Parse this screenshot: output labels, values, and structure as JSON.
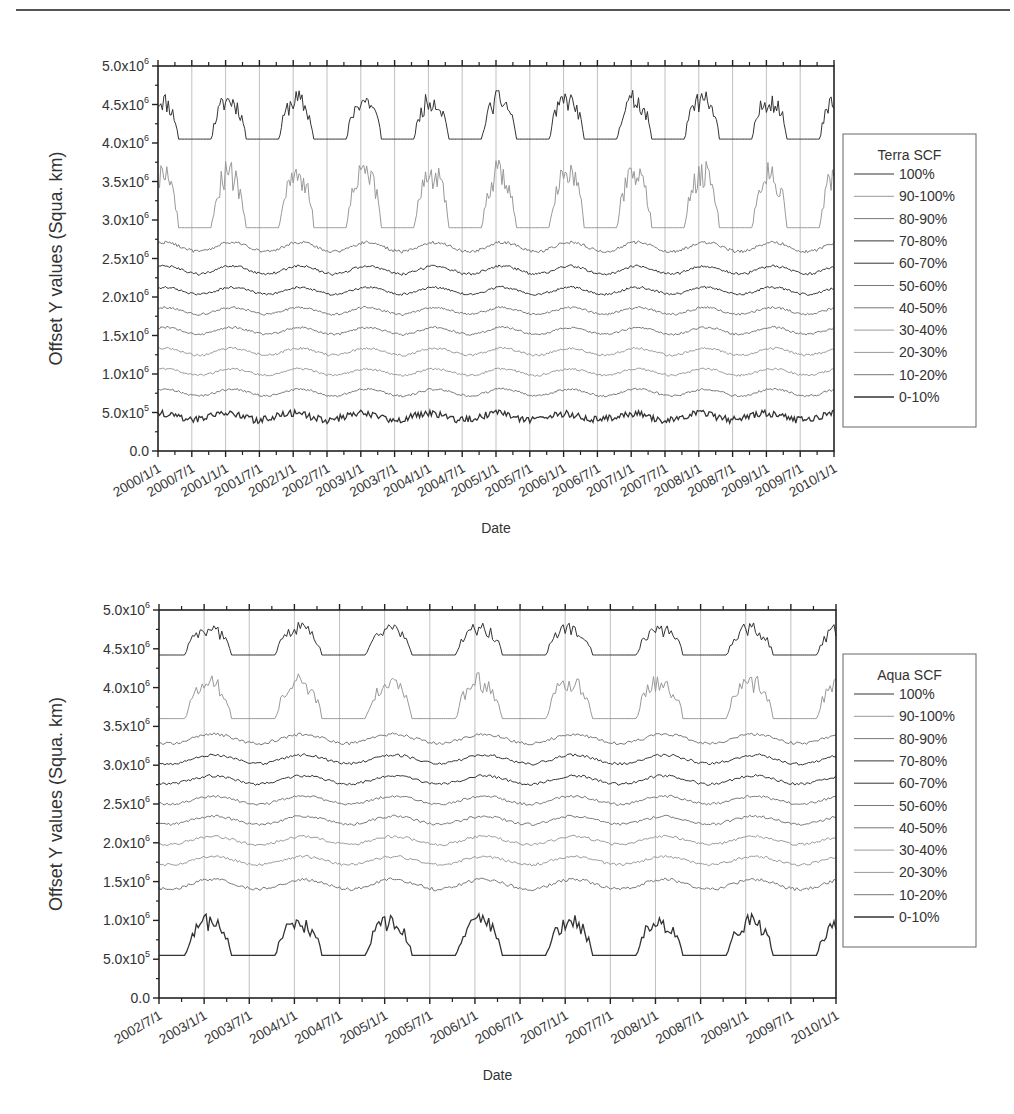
{
  "chart_data": [
    {
      "type": "line",
      "title": "",
      "xlabel": "Date",
      "ylabel": "Offset Y values (Squa. km)",
      "ylim": [
        0,
        5000000
      ],
      "yticks": [
        "0.0",
        "5.0x10^5",
        "1.0x10^6",
        "1.5x10^6",
        "2.0x10^6",
        "2.5x10^6",
        "3.0x10^6",
        "3.5x10^6",
        "4.0x10^6",
        "4.5x10^6",
        "5.0x10^6"
      ],
      "xticks": [
        "2000/1/1",
        "2000/7/1",
        "2001/1/1",
        "2001/7/1",
        "2002/1/1",
        "2002/7/1",
        "2003/1/1",
        "2003/7/1",
        "2004/1/1",
        "2004/7/1",
        "2005/1/1",
        "2005/7/1",
        "2006/1/1",
        "2006/7/1",
        "2007/1/1",
        "2007/7/1",
        "2008/1/1",
        "2008/7/1",
        "2009/1/1",
        "2009/7/1",
        "2010/1/1"
      ],
      "grid": "vertical lines at each Jan 1 / Jul 1",
      "legend": {
        "title": "Terra SCF",
        "position": "right-outside"
      },
      "series": [
        {
          "name": "100%",
          "baseline": 4050000,
          "peak": 4700000,
          "amplitude_type": "seasonal-large"
        },
        {
          "name": "90-100%",
          "baseline": 2900000,
          "peak": 3800000,
          "amplitude_type": "seasonal-large"
        },
        {
          "name": "80-90%",
          "baseline": 2570000,
          "peak": 2730000,
          "amplitude_type": "seasonal-small"
        },
        {
          "name": "70-80%",
          "baseline": 2280000,
          "peak": 2420000,
          "amplitude_type": "seasonal-small"
        },
        {
          "name": "60-70%",
          "baseline": 2020000,
          "peak": 2140000,
          "amplitude_type": "seasonal-small"
        },
        {
          "name": "50-60%",
          "baseline": 1760000,
          "peak": 1880000,
          "amplitude_type": "seasonal-small"
        },
        {
          "name": "40-50%",
          "baseline": 1500000,
          "peak": 1620000,
          "amplitude_type": "seasonal-small"
        },
        {
          "name": "30-40%",
          "baseline": 1230000,
          "peak": 1350000,
          "amplitude_type": "seasonal-small"
        },
        {
          "name": "20-30%",
          "baseline": 970000,
          "peak": 1080000,
          "amplitude_type": "seasonal-small"
        },
        {
          "name": "10-20%",
          "baseline": 700000,
          "peak": 820000,
          "amplitude_type": "seasonal-small"
        },
        {
          "name": "0-10%",
          "baseline": 330000,
          "peak": 560000,
          "amplitude_type": "noisy"
        }
      ]
    },
    {
      "type": "line",
      "title": "",
      "xlabel": "Date",
      "ylabel": "Offset Y values (Squa. km)",
      "ylim": [
        0,
        5000000
      ],
      "yticks": [
        "0.0",
        "5.0x10^5",
        "1.0x10^6",
        "1.5x10^6",
        "2.0x10^6",
        "2.5x10^6",
        "3.0x10^6",
        "3.5x10^6",
        "4.0x10^6",
        "4.5x10^6",
        "5.0x10^6"
      ],
      "xticks": [
        "2002/7/1",
        "2003/1/1",
        "2003/7/1",
        "2004/1/1",
        "2004/7/1",
        "2005/1/1",
        "2005/7/1",
        "2006/1/1",
        "2006/7/1",
        "2007/1/1",
        "2007/7/1",
        "2008/1/1",
        "2008/7/1",
        "2009/1/1",
        "2009/7/1",
        "2010/1/1"
      ],
      "grid": "vertical lines at each Jan 1 / Jul 1",
      "legend": {
        "title": "Aqua SCF",
        "position": "right-outside"
      },
      "series": [
        {
          "name": "100%",
          "baseline": 4420000,
          "peak": 4850000,
          "amplitude_type": "seasonal-large"
        },
        {
          "name": "90-100%",
          "baseline": 3600000,
          "peak": 4200000,
          "amplitude_type": "seasonal-large"
        },
        {
          "name": "80-90%",
          "baseline": 3260000,
          "peak": 3420000,
          "amplitude_type": "seasonal-small"
        },
        {
          "name": "70-80%",
          "baseline": 3000000,
          "peak": 3150000,
          "amplitude_type": "seasonal-small"
        },
        {
          "name": "60-70%",
          "baseline": 2740000,
          "peak": 2880000,
          "amplitude_type": "seasonal-small"
        },
        {
          "name": "50-60%",
          "baseline": 2480000,
          "peak": 2620000,
          "amplitude_type": "seasonal-small"
        },
        {
          "name": "40-50%",
          "baseline": 2220000,
          "peak": 2360000,
          "amplitude_type": "seasonal-small"
        },
        {
          "name": "30-40%",
          "baseline": 1960000,
          "peak": 2100000,
          "amplitude_type": "seasonal-small"
        },
        {
          "name": "20-30%",
          "baseline": 1700000,
          "peak": 1840000,
          "amplitude_type": "seasonal-small"
        },
        {
          "name": "10-20%",
          "baseline": 1380000,
          "peak": 1550000,
          "amplitude_type": "seasonal-small"
        },
        {
          "name": "0-10%",
          "baseline": 550000,
          "peak": 1100000,
          "amplitude_type": "seasonal-large"
        }
      ]
    }
  ],
  "charts": {
    "terra": {
      "ylabel": "Offset Y values (Squa. km)",
      "xlabel": "Date",
      "legend_title": "Terra SCF",
      "legend_items": [
        "100%",
        "90-100%",
        "80-90%",
        "70-80%",
        "60-70%",
        "50-60%",
        "40-50%",
        "30-40%",
        "20-30%",
        "10-20%",
        "0-10%"
      ]
    },
    "aqua": {
      "ylabel": "Offset Y values (Squa. km)",
      "xlabel": "Date",
      "legend_title": "Aqua SCF",
      "legend_items": [
        "100%",
        "90-100%",
        "80-90%",
        "70-80%",
        "60-70%",
        "50-60%",
        "40-50%",
        "30-40%",
        "20-30%",
        "10-20%",
        "0-10%"
      ]
    }
  },
  "colors": {
    "axis": "#222222",
    "grid": "#b0b0b0",
    "series_dark": "#333333",
    "series_mid": "#777777",
    "series_light": "#999999"
  }
}
